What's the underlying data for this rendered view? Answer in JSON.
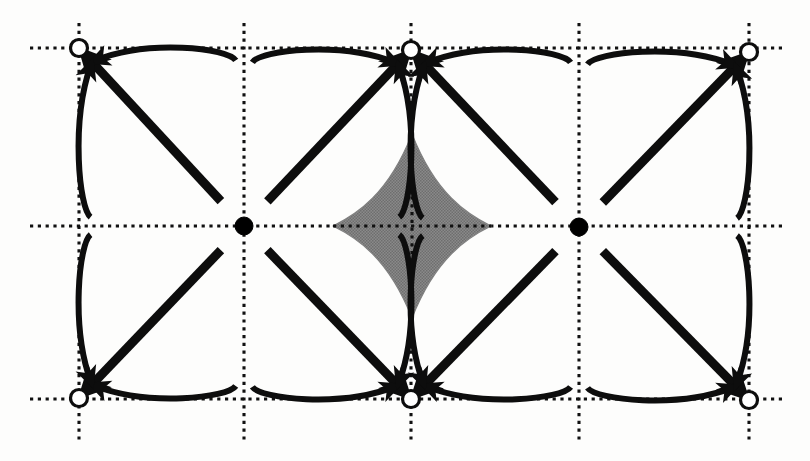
{
  "figure": {
    "title": "Periodic lattice phase portrait with source nodes, sink nodes and shaded astroid region",
    "caption": "",
    "background_color": "#fdfdfc",
    "canvas": {
      "width": 810,
      "height": 461
    }
  },
  "style": {
    "stroke_color": "#0d0d0d",
    "shaded_region_color": "#808080",
    "shaded_region_stroke": "#0d0d0d",
    "grid_color": "#111111",
    "node_fill_color": "#000000",
    "node_open_fill": "#ffffff",
    "thick_arrow_width": 9,
    "thin_arrow_width": 6,
    "grid_dot_size": 3.2,
    "grid_dot_gap": 4.6
  },
  "chart_data": {
    "type": "scatter",
    "title": "Periodic lattice phase portrait",
    "xlabel": "",
    "ylabel": "",
    "grid": true,
    "legend": null,
    "xlim": [
      30,
      785
    ],
    "ylim": [
      23,
      440
    ],
    "grid_lines": {
      "vertical_x": [
        79,
        244,
        411,
        579,
        749
      ],
      "horizontal_y": [
        48,
        226,
        399
      ],
      "vertical_span_y": [
        23,
        440
      ],
      "horizontal_span_x": [
        30,
        785
      ]
    },
    "nodes": [
      {
        "id": "sink-tl",
        "label": "open-node",
        "kind": "open",
        "x": 79,
        "y": 48,
        "r": 8.5
      },
      {
        "id": "sink-tm",
        "label": "open-node",
        "kind": "open",
        "x": 411,
        "y": 50,
        "r": 8.5
      },
      {
        "id": "sink-tr",
        "label": "open-node",
        "kind": "open",
        "x": 749,
        "y": 52,
        "r": 8.5
      },
      {
        "id": "sink-bl",
        "label": "open-node",
        "kind": "open",
        "x": 79,
        "y": 398,
        "r": 8.5
      },
      {
        "id": "sink-bm",
        "label": "open-node",
        "kind": "open",
        "x": 411,
        "y": 399,
        "r": 8.5
      },
      {
        "id": "sink-br",
        "label": "open-node",
        "kind": "open",
        "x": 749,
        "y": 400,
        "r": 8.5
      },
      {
        "id": "source-l",
        "label": "filled-node",
        "kind": "filled",
        "x": 244,
        "y": 226,
        "r": 9.0
      },
      {
        "id": "source-r",
        "label": "filled-node",
        "kind": "filled",
        "x": 579,
        "y": 227,
        "r": 9.0
      }
    ],
    "shaded_regions": [
      {
        "id": "astroid",
        "label": "shaded-astroid-region",
        "center": [
          412,
          226
        ],
        "half_width": 79,
        "half_height": 92,
        "fill": "#808080"
      }
    ],
    "flow_cells": [
      {
        "id": "cell-l-tl",
        "source": "source-l",
        "sink": "sink-tl",
        "dx": -1,
        "dy": -1
      },
      {
        "id": "cell-l-tr",
        "source": "source-l",
        "sink": "sink-tm",
        "dx": 1,
        "dy": -1
      },
      {
        "id": "cell-l-bl",
        "source": "source-l",
        "sink": "sink-bl",
        "dx": -1,
        "dy": 1
      },
      {
        "id": "cell-l-br",
        "source": "source-l",
        "sink": "sink-bm",
        "dx": 1,
        "dy": 1
      },
      {
        "id": "cell-r-tl",
        "source": "source-r",
        "sink": "sink-tm",
        "dx": -1,
        "dy": -1
      },
      {
        "id": "cell-r-tr",
        "source": "source-r",
        "sink": "sink-tr",
        "dx": 1,
        "dy": -1
      },
      {
        "id": "cell-r-bl",
        "source": "source-r",
        "sink": "sink-bm",
        "dx": -1,
        "dy": 1
      },
      {
        "id": "cell-r-br",
        "source": "source-r",
        "sink": "sink-br",
        "dx": 1,
        "dy": 1
      }
    ],
    "arrows_per_cell": 3,
    "arrow_description": "One thick straight diagonal arrow from the filled source node to the open sink node, flanked by two thinner arrows that bow outward toward the horizontal and vertical grid lines."
  }
}
